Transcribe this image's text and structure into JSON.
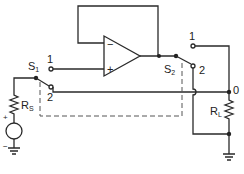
{
  "diagram": {
    "type": "circuit-schematic",
    "components": {
      "opamp": {
        "minus_label": "−",
        "plus_label": "+"
      },
      "switch1": {
        "name": "S",
        "sub": "1",
        "pos1": "1",
        "pos2": "2"
      },
      "switch2": {
        "name": "S",
        "sub": "2",
        "pos1": "1",
        "pos2": "2"
      },
      "source_resistor": {
        "name": "R",
        "sub": "S"
      },
      "load_resistor": {
        "name": "R",
        "sub": "L"
      },
      "source": {
        "plus": "+",
        "minus": "−"
      },
      "output_node": "0"
    },
    "colors": {
      "wire": "#2a2a2a",
      "background": "#ffffff"
    }
  }
}
